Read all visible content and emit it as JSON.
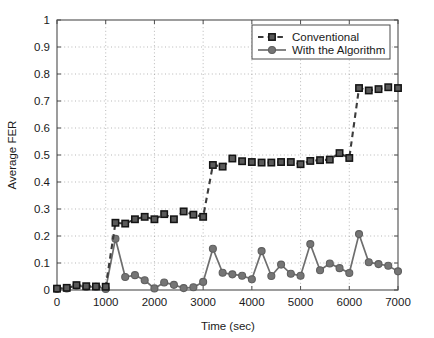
{
  "chart_data": {
    "type": "line",
    "title": "",
    "xlabel": "Time (sec)",
    "ylabel": "Average FER",
    "xlim": [
      0,
      7000
    ],
    "ylim": [
      0,
      1
    ],
    "grid": true,
    "legend_position": "top-right",
    "xticks": [
      0,
      1000,
      2000,
      3000,
      4000,
      5000,
      6000,
      7000
    ],
    "xtick_labels": [
      "0",
      "1000",
      "2000",
      "3000",
      "4000",
      "5000",
      "6000",
      "7000"
    ],
    "yticks": [
      0,
      0.1,
      0.2,
      0.3,
      0.4,
      0.5,
      0.6,
      0.7,
      0.8,
      0.9,
      1
    ],
    "ytick_labels": [
      "0",
      "0.1",
      "0.2",
      "0.3",
      "0.4",
      "0.5",
      "0.6",
      "0.7",
      "0.8",
      "0.9",
      "1"
    ],
    "x": [
      0,
      200,
      400,
      600,
      800,
      1000,
      1200,
      1400,
      1600,
      1800,
      2000,
      2200,
      2400,
      2600,
      2800,
      3000,
      3200,
      3400,
      3600,
      3800,
      4000,
      4200,
      4400,
      4600,
      4800,
      5000,
      5200,
      5400,
      5600,
      5800,
      6000,
      6200,
      6400,
      6600,
      6800,
      7000
    ],
    "series": [
      {
        "name": "Conventional",
        "marker": "square",
        "linestyle": "dashed",
        "color": "#3b3b3b",
        "values": [
          0.005,
          0.008,
          0.018,
          0.014,
          0.013,
          0.012,
          0.249,
          0.246,
          0.262,
          0.271,
          0.262,
          0.281,
          0.262,
          0.291,
          0.279,
          0.271,
          0.463,
          0.457,
          0.487,
          0.477,
          0.474,
          0.472,
          0.472,
          0.474,
          0.474,
          0.466,
          0.478,
          0.481,
          0.483,
          0.507,
          0.489,
          0.748,
          0.739,
          0.744,
          0.751,
          0.748
        ]
      },
      {
        "name": "With the Algorithm",
        "marker": "circle",
        "linestyle": "solid",
        "color": "#6e6e6e",
        "values": [
          0.004,
          0.006,
          0.016,
          0.011,
          0.012,
          0.004,
          0.19,
          0.048,
          0.055,
          0.036,
          0.006,
          0.028,
          0.019,
          0.007,
          0.01,
          0.03,
          0.153,
          0.064,
          0.058,
          0.053,
          0.04,
          0.144,
          0.052,
          0.094,
          0.06,
          0.053,
          0.17,
          0.073,
          0.098,
          0.081,
          0.063,
          0.207,
          0.103,
          0.096,
          0.09,
          0.069
        ]
      }
    ]
  },
  "legend": {
    "items": [
      {
        "label": "Conventional"
      },
      {
        "label": "With the Algorithm"
      }
    ]
  }
}
